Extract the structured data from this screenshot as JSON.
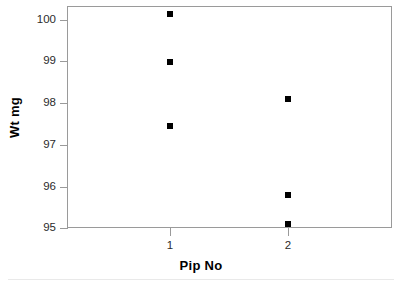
{
  "chart_data": {
    "type": "scatter",
    "title": "",
    "xlabel": "Pip No",
    "ylabel": "Wt mg",
    "xlim": [
      0.5,
      3.3
    ],
    "ylim": [
      95,
      100.35
    ],
    "grid": false,
    "legend": "none",
    "marker": {
      "shape": "square",
      "color": "#000000",
      "size_px": 6
    },
    "x_tick_labels": [
      "1",
      "2"
    ],
    "x_tick_values": [
      1,
      2
    ],
    "y_tick_labels": [
      "95",
      "96",
      "97",
      "98",
      "99",
      "100"
    ],
    "y_tick_values": [
      95,
      96,
      97,
      98,
      99,
      100
    ],
    "categories": [
      "1",
      "2"
    ],
    "points": [
      {
        "x": 1,
        "y": 100.15
      },
      {
        "x": 1,
        "y": 99.0
      },
      {
        "x": 1,
        "y": 97.45
      },
      {
        "x": 2,
        "y": 98.1
      },
      {
        "x": 2,
        "y": 95.8
      },
      {
        "x": 2,
        "y": 95.1
      }
    ],
    "series": [
      {
        "name": "Pip No 1",
        "x": [
          1,
          1,
          1
        ],
        "values": [
          100.15,
          99.0,
          97.45
        ]
      },
      {
        "name": "Pip No 2",
        "x": [
          2,
          2,
          2
        ],
        "values": [
          98.1,
          95.8,
          95.1
        ]
      }
    ],
    "colors": {
      "marker": "#000000",
      "axis": "#9a9a9a",
      "text": "#2b2b2b",
      "title_text": "#000000",
      "background": "#ffffff"
    }
  },
  "axes": {
    "y": {
      "title": "Wt mg",
      "ticks": [
        {
          "label": "100",
          "value": 100
        },
        {
          "label": "99",
          "value": 99
        },
        {
          "label": "98",
          "value": 98
        },
        {
          "label": "97",
          "value": 97
        },
        {
          "label": "96",
          "value": 96
        },
        {
          "label": "95",
          "value": 95
        }
      ]
    },
    "x": {
      "title": "Pip No",
      "ticks": [
        {
          "label": "1",
          "value": 1
        },
        {
          "label": "2",
          "value": 2
        }
      ]
    }
  }
}
